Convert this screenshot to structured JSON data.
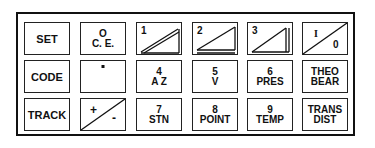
{
  "keypad": {
    "row1": {
      "set": "SET",
      "ce_top": "O",
      "ce_bottom": "C. E.",
      "k1": "1",
      "k2": "2",
      "k3": "3",
      "io_top": "I",
      "io_bottom": "0"
    },
    "row2": {
      "code": "CODE",
      "decimal": "·",
      "k4_top": "4",
      "k4_bottom": "A Z",
      "k5_top": "5",
      "k5_bottom": "V",
      "k6_top": "6",
      "k6_bottom": "PRES",
      "theo_top": "THEO",
      "theo_bottom": "BEAR"
    },
    "row3": {
      "track": "TRACK",
      "plus": "+",
      "minus": "-",
      "k7_top": "7",
      "k7_bottom": "STN",
      "k8_top": "8",
      "k8_bottom": "POINT",
      "k9_top": "9",
      "k9_bottom": "TEMP",
      "trans_top": "TRANS",
      "trans_bottom": "DIST"
    }
  },
  "colors": {
    "ink": "#111111",
    "background": "#ffffff"
  }
}
